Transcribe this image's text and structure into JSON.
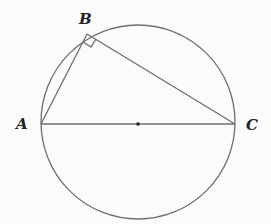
{
  "diagram": {
    "points": {
      "A": {
        "label": "A"
      },
      "B": {
        "label": "B"
      },
      "C": {
        "label": "C"
      },
      "O": {
        "label": ""
      }
    },
    "segments": [
      "AB",
      "BC",
      "AC"
    ],
    "right_angle_at": "B",
    "center_marked": true,
    "stroke_color": "#6e6e6e",
    "label_color": "#222222"
  }
}
